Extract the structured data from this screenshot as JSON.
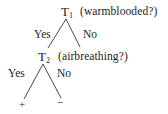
{
  "diagram": {
    "type": "decision-tree",
    "nodes": [
      {
        "id": "T1",
        "label": "T",
        "subscript": "1",
        "question": "(warmblooded?)"
      },
      {
        "id": "T2",
        "label": "T",
        "subscript": "2",
        "question": "(airbreathing?)"
      }
    ],
    "edges": [
      {
        "from": "T1",
        "to": "T2",
        "label": "Yes"
      },
      {
        "from": "T1",
        "to": "none",
        "label": "No"
      },
      {
        "from": "T2",
        "to": "plus",
        "label": "Yes"
      },
      {
        "from": "T2",
        "to": "minus",
        "label": "No"
      }
    ],
    "leaves": {
      "plus": "+",
      "minus": "−"
    }
  }
}
